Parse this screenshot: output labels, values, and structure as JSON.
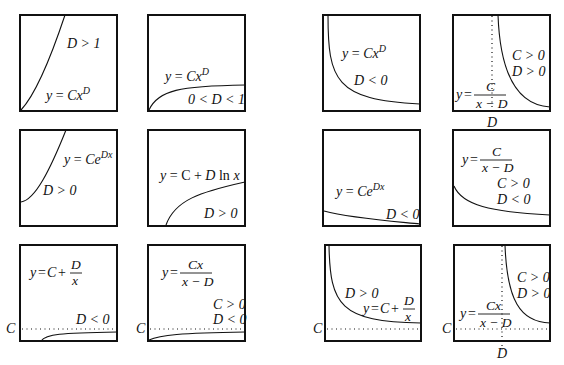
{
  "figure": {
    "title": "",
    "colors": {
      "ink": "#111111",
      "background": "#ffffff"
    },
    "panels": [
      {
        "id": "r1c1",
        "formula": "y = Cx^D",
        "conditions": [
          "D > 1"
        ]
      },
      {
        "id": "r1c2",
        "formula": "y = Cx^D",
        "conditions": [
          "0 < D < 1"
        ]
      },
      {
        "id": "r1c3",
        "formula": "y = Cx^D",
        "conditions": [
          "D < 0"
        ]
      },
      {
        "id": "r1c4",
        "formula": "y = C/(x - D)",
        "conditions": [
          "C > 0",
          "D > 0"
        ],
        "axis_marks": [
          "D"
        ]
      },
      {
        "id": "r2c1",
        "formula": "y = Ce^(Dx)",
        "conditions": [
          "D > 0"
        ]
      },
      {
        "id": "r2c2",
        "formula": "y = C + D ln x",
        "conditions": [
          "D > 0"
        ]
      },
      {
        "id": "r2c3",
        "formula": "y = Ce^(Dx)",
        "conditions": [
          "D < 0"
        ]
      },
      {
        "id": "r2c4",
        "formula": "y = C/(x - D)",
        "conditions": [
          "C > 0",
          "D < 0"
        ]
      },
      {
        "id": "r3c1",
        "formula": "y = C + D/x",
        "conditions": [
          "D < 0"
        ],
        "axis_marks": [
          "C"
        ]
      },
      {
        "id": "r3c2",
        "formula": "y = Cx/(x - D)",
        "conditions": [
          "C > 0",
          "D < 0"
        ],
        "axis_marks": [
          "C"
        ]
      },
      {
        "id": "r3c3",
        "formula": "y = C + D/x",
        "conditions": [
          "D > 0"
        ],
        "axis_marks": [
          "C"
        ]
      },
      {
        "id": "r3c4",
        "formula": "y = Cx/(x - D)",
        "conditions": [
          "C > 0",
          "D > 0"
        ],
        "axis_marks": [
          "C",
          "D"
        ]
      }
    ]
  },
  "t": {
    "y": "y",
    "eq": " = ",
    "eqs": "=",
    "C": "C",
    "x": "x",
    "D": "D",
    "Cx": "Cx",
    "Ce": "Ce",
    "Dx": "Dx",
    "plus": " + ",
    "lnx_pre": "C + ",
    "ln": " ln ",
    "xminusD": "x − D",
    "cond_D_gt_1": "D > 1",
    "cond_0_D_1": "0 < D < 1",
    "cond_D_lt_0": "D < 0",
    "cond_D_gt_0": "D > 0",
    "cond_C_gt_0": "C > 0"
  }
}
